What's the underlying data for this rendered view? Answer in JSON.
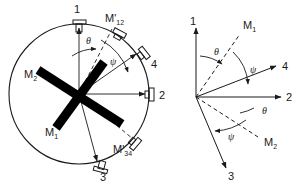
{
  "figure": {
    "type": "scientific-schematic",
    "background_color": "#ffffff",
    "line_color": "#1a1a1a",
    "magnet_color": "#000000"
  },
  "left_panel": {
    "name": "sample-chamber",
    "circle": {
      "cx": 79,
      "cy": 94,
      "r": 70
    },
    "detectors": [
      {
        "id": "det-1",
        "label": "1",
        "angle_deg": 90,
        "label_x": 74,
        "label_y": 13
      },
      {
        "id": "det-2",
        "label": "2",
        "angle_deg": 0,
        "label_x": 159,
        "label_y": 99
      },
      {
        "id": "det-3",
        "label": "3",
        "angle_deg": -75,
        "label_x": 100,
        "label_y": 180
      },
      {
        "id": "det-4",
        "label": "4",
        "angle_deg": 35,
        "label_x": 151,
        "label_y": 68
      },
      {
        "id": "det-m12",
        "label": "M'",
        "sub": "12",
        "angle_deg": 62,
        "label_x": 105,
        "label_y": 22
      },
      {
        "id": "det-m34",
        "label": "M'",
        "sub": "34",
        "angle_deg": -40,
        "label_x": 113,
        "label_y": 150
      }
    ],
    "magnet_labels": [
      {
        "id": "magnet-m2",
        "label": "M",
        "sub": "2",
        "x": 24,
        "y": 75
      },
      {
        "id": "magnet-m1",
        "label": "M",
        "sub": "1",
        "x": 45,
        "y": 133
      }
    ],
    "angles": [
      {
        "id": "angle-theta",
        "symbol": "θ",
        "x": 86,
        "y": 41
      },
      {
        "id": "angle-psi",
        "symbol": "ψ",
        "x": 110,
        "y": 62
      }
    ]
  },
  "right_panel": {
    "name": "vector-axis-diagram",
    "origin": {
      "x": 196,
      "y": 97
    },
    "axes": [
      {
        "id": "axis-1",
        "label": "1",
        "angle_deg": 90,
        "length": 76,
        "label_x": 190,
        "label_y": 22
      },
      {
        "id": "axis-2",
        "label": "2",
        "angle_deg": 0,
        "length": 86,
        "label_x": 288,
        "label_y": 101
      },
      {
        "id": "axis-3",
        "label": "3",
        "angle_deg": -73,
        "length": 80,
        "label_x": 232,
        "label_y": 179
      },
      {
        "id": "axis-4",
        "label": "4",
        "angle_deg": 22,
        "length": 84,
        "label_x": 285,
        "label_y": 71
      }
    ],
    "vectors": [
      {
        "id": "vector-m1",
        "label": "M",
        "sub": "1",
        "angle_deg": 57,
        "length": 74,
        "label_x": 243,
        "label_y": 26,
        "style": "dashed"
      },
      {
        "id": "vector-m2",
        "label": "M",
        "sub": "2",
        "angle_deg": -33,
        "length": 76,
        "label_x": 264,
        "label_y": 143,
        "style": "dashed"
      }
    ],
    "angles": [
      {
        "id": "angle-theta-upper",
        "symbol": "θ",
        "x": 216,
        "y": 52
      },
      {
        "id": "angle-psi-upper",
        "symbol": "ψ",
        "x": 252,
        "y": 70
      },
      {
        "id": "angle-theta-lower",
        "symbol": "θ",
        "x": 263,
        "y": 111
      },
      {
        "id": "angle-psi-lower",
        "symbol": "ψ",
        "x": 230,
        "y": 137
      }
    ]
  }
}
